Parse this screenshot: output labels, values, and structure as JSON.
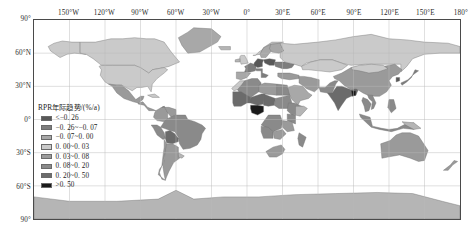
{
  "figure": {
    "kind": "world-choropleth-map",
    "projection_note": "equirectangular"
  },
  "axes": {
    "longitude_labels": [
      "150°W",
      "120°W",
      "90°W",
      "60°W",
      "30°W",
      "0°",
      "30°E",
      "60°E",
      "90°E",
      "120°E",
      "150°E",
      "180°"
    ],
    "longitude_values": [
      -150,
      -120,
      -90,
      -60,
      -30,
      0,
      30,
      60,
      90,
      120,
      150,
      180
    ],
    "latitude_labels": [
      "90°",
      "60°N",
      "30°N",
      "0°",
      "30°S",
      "60°S",
      "90°"
    ],
    "latitude_values": [
      90,
      60,
      30,
      0,
      -30,
      -60,
      -90
    ],
    "lon_range": [
      -180,
      180
    ],
    "lat_range": [
      -90,
      90
    ],
    "grid": true,
    "grid_color": "#b9b9b9",
    "frame_color": "#4a4a4a"
  },
  "legend": {
    "title": "RPR年际趋势/(%/a)",
    "entries": [
      {
        "label": "<−0. 26",
        "color": "#585858"
      },
      {
        "label": "−0. 26~−0. 07",
        "color": "#7d7d7d"
      },
      {
        "label": "−0. 07~0. 00",
        "color": "#a8a8a8"
      },
      {
        "label": "0. 00~0. 03",
        "color": "#cacaca"
      },
      {
        "label": "0. 03~0. 08",
        "color": "#9a9a9a"
      },
      {
        "label": "0. 08~0. 20",
        "color": "#8a8a8a"
      },
      {
        "label": "0. 20~0. 50",
        "color": "#6b6b6b"
      },
      {
        "label": ">0. 50",
        "color": "#1a1a1a"
      }
    ]
  },
  "chart_data": {
    "type": "heatmap",
    "title": "RPR年际趋势/(%/a)",
    "xlabel": "",
    "ylabel": "",
    "xlim": [
      -180,
      180
    ],
    "ylim": [
      -90,
      90
    ],
    "grid": true,
    "legend_position": "inside-left",
    "variable": "RPR年际趋势",
    "unit": "%/a",
    "class_breaks": [
      -0.26,
      -0.07,
      0.0,
      0.03,
      0.08,
      0.2,
      0.5
    ],
    "class_labels": [
      "<−0. 26",
      "−0. 26~−0. 07",
      "−0. 07~0. 00",
      "0. 00~0. 03",
      "0. 03~0. 08",
      "0. 08~0. 20",
      "0. 20~0. 50",
      ">0. 50"
    ],
    "class_colors": [
      "#585858",
      "#7d7d7d",
      "#a8a8a8",
      "#cacaca",
      "#9a9a9a",
      "#8a8a8a",
      "#6b6b6b",
      "#1a1a1a"
    ],
    "regions": [
      {
        "name": "Canada",
        "class": 3
      },
      {
        "name": "United States",
        "class": 3
      },
      {
        "name": "Alaska",
        "class": 3
      },
      {
        "name": "Greenland",
        "class": 2
      },
      {
        "name": "Mexico",
        "class": 4
      },
      {
        "name": "Central America",
        "class": 4
      },
      {
        "name": "Cuba",
        "class": 3
      },
      {
        "name": "Brazil",
        "class": 5
      },
      {
        "name": "Argentina",
        "class": 4
      },
      {
        "name": "Chile",
        "class": 4
      },
      {
        "name": "Peru",
        "class": 5
      },
      {
        "name": "Bolivia",
        "class": 6
      },
      {
        "name": "Colombia",
        "class": 4
      },
      {
        "name": "Venezuela",
        "class": 4
      },
      {
        "name": "Morocco",
        "class": 3
      },
      {
        "name": "Algeria",
        "class": 5
      },
      {
        "name": "Libya",
        "class": 4
      },
      {
        "name": "Egypt",
        "class": 5
      },
      {
        "name": "Mali",
        "class": 6
      },
      {
        "name": "Niger",
        "class": 6
      },
      {
        "name": "Nigeria",
        "class": 7
      },
      {
        "name": "Chad",
        "class": 6
      },
      {
        "name": "Sudan",
        "class": 5
      },
      {
        "name": "Ethiopia",
        "class": 5
      },
      {
        "name": "Kenya",
        "class": 5
      },
      {
        "name": "Tanzania",
        "class": 4
      },
      {
        "name": "D.R. Congo",
        "class": 5
      },
      {
        "name": "Angola",
        "class": 5
      },
      {
        "name": "Zambia",
        "class": 4
      },
      {
        "name": "South Africa",
        "class": 4
      },
      {
        "name": "Madagascar",
        "class": 5
      },
      {
        "name": "Norway",
        "class": 3
      },
      {
        "name": "Sweden",
        "class": 2
      },
      {
        "name": "Finland",
        "class": 2
      },
      {
        "name": "United Kingdom",
        "class": 3
      },
      {
        "name": "France",
        "class": 1
      },
      {
        "name": "Spain",
        "class": 2
      },
      {
        "name": "Germany",
        "class": 0
      },
      {
        "name": "Poland",
        "class": 0
      },
      {
        "name": "Ukraine",
        "class": 1
      },
      {
        "name": "Italy",
        "class": 1
      },
      {
        "name": "Turkey",
        "class": 4
      },
      {
        "name": "Russia",
        "class": 3
      },
      {
        "name": "Kazakhstan",
        "class": 3
      },
      {
        "name": "Saudi Arabia",
        "class": 2
      },
      {
        "name": "Iran",
        "class": 4
      },
      {
        "name": "India",
        "class": 6
      },
      {
        "name": "Pakistan",
        "class": 5
      },
      {
        "name": "Bangladesh",
        "class": 7
      },
      {
        "name": "China",
        "class": 4
      },
      {
        "name": "Mongolia",
        "class": 3
      },
      {
        "name": "Japan",
        "class": 1
      },
      {
        "name": "Korea",
        "class": 0
      },
      {
        "name": "Thailand",
        "class": 5
      },
      {
        "name": "Vietnam",
        "class": 5
      },
      {
        "name": "Indonesia",
        "class": 5
      },
      {
        "name": "Philippines",
        "class": 5
      },
      {
        "name": "Australia",
        "class": 4
      },
      {
        "name": "New Zealand",
        "class": 4
      }
    ]
  }
}
